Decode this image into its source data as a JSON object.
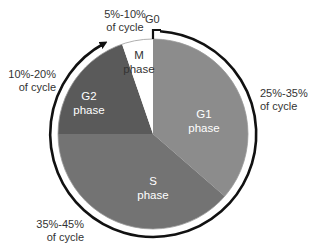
{
  "diagram": {
    "marker": {
      "label": "G0"
    },
    "phases": [
      {
        "id": "g1",
        "name": "G1",
        "word": "phase",
        "range": "25%-35%",
        "suffix": "of cycle",
        "color": "#8c8c8c"
      },
      {
        "id": "s",
        "name": "S",
        "word": "phase",
        "range": "35%-45%",
        "suffix": "of cycle",
        "color": "#737373"
      },
      {
        "id": "g2",
        "name": "G2",
        "word": "phase",
        "range": "10%-20%",
        "suffix": "of cycle",
        "color": "#5a5a5a"
      },
      {
        "id": "m",
        "name": "M",
        "word": "phase",
        "range": "5%-10%",
        "suffix": "of cycle",
        "color": "#ffffff"
      }
    ],
    "ring_color": "#111111"
  }
}
